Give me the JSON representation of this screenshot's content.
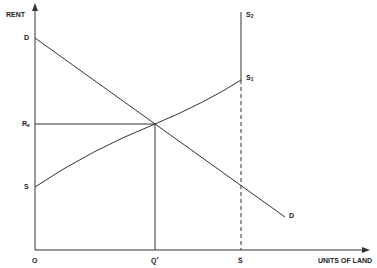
{
  "diagram": {
    "type": "supply-demand",
    "y_axis_label": "RENT",
    "x_axis_label": "UNITS OF LAND",
    "origin_label": "O",
    "curves": {
      "demand": {
        "label_start": "D",
        "label_end": "D"
      },
      "supply_lower": {
        "label": "S"
      },
      "supply_1": {
        "base": "S",
        "sub": "1"
      },
      "supply_2": {
        "base": "S",
        "sub": "2"
      }
    },
    "equilibrium_rent": {
      "base": "R",
      "sub": "e"
    },
    "equilibrium_quantity": {
      "base": "Q",
      "sup": "*"
    },
    "fixed_supply": {
      "label": "S̅"
    }
  },
  "colors": {
    "line": "#333333",
    "text": "#222222",
    "background": "#ffffff"
  }
}
